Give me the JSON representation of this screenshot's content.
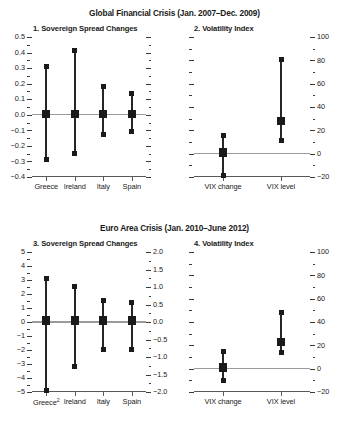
{
  "figure": {
    "blocks": [
      {
        "id": "global-financial-crisis",
        "title": "Global Financial Crisis (Jan. 2007–Dec. 2009)"
      },
      {
        "id": "euro-area-crisis",
        "title": "Euro Area Crisis (Jan. 2010–June 2012)"
      }
    ]
  },
  "chart_data": [
    {
      "type": "scatter",
      "id": "panel-1",
      "title": "1. Sovereign Spread Changes",
      "xlabel": "",
      "ylabel": "",
      "ylim": [
        -0.4,
        0.5
      ],
      "yticks": [
        -0.4,
        -0.3,
        -0.2,
        -0.1,
        0.0,
        0.1,
        0.2,
        0.3,
        0.4,
        0.5
      ],
      "yticklabels": [
        "-0.4",
        "-0.3",
        "-0.2",
        "-0.1",
        "0.0",
        "0.1",
        "0.2",
        "0.3",
        "0.4",
        "0.5"
      ],
      "y_minor_step": 0.05,
      "axis_side": "left",
      "right_axis_ticks_only": true,
      "grid": false,
      "zero_reference": 0.0,
      "categories": [
        "Greece",
        "Ireland",
        "Italy",
        "Spain"
      ],
      "series": [
        {
          "name": "upper",
          "values": [
            0.31,
            0.415,
            0.18,
            0.14
          ]
        },
        {
          "name": "middle",
          "values": [
            0.005,
            0.005,
            0.005,
            0.005
          ]
        },
        {
          "name": "lower",
          "values": [
            -0.29,
            -0.248,
            -0.128,
            -0.105
          ]
        }
      ]
    },
    {
      "type": "scatter",
      "id": "panel-2",
      "title": "2. Volatility Index",
      "xlabel": "",
      "ylabel": "",
      "ylim": [
        -20,
        100
      ],
      "yticks": [
        -20,
        0,
        20,
        40,
        60,
        80,
        100
      ],
      "yticklabels": [
        "-20",
        "0",
        "20",
        "40",
        "60",
        "80",
        "100"
      ],
      "y_minor_step": 10,
      "axis_side": "right",
      "left_axis_ticks_only": true,
      "grid": false,
      "zero_reference": 0,
      "categories": [
        "VIX change",
        "VIX level"
      ],
      "series": [
        {
          "name": "upper",
          "values": [
            15.5,
            81.0
          ]
        },
        {
          "name": "middle",
          "values": [
            1.0,
            28.0
          ]
        },
        {
          "name": "lower",
          "values": [
            -19.0,
            11.0
          ]
        }
      ]
    },
    {
      "type": "scatter",
      "id": "panel-3",
      "title": "3. Sovereign Spread Changes",
      "xlabel": "",
      "ylabel": "",
      "ylim": [
        -5,
        5
      ],
      "yticks": [
        -5,
        -4,
        -3,
        -2,
        -1,
        0,
        1,
        2,
        3,
        4,
        5
      ],
      "yticklabels": [
        "-5",
        "-4",
        "-3",
        "-2",
        "-1",
        "0",
        "1",
        "2",
        "3",
        "4",
        "5"
      ],
      "y_minor_step": 0.5,
      "axis_side": "left",
      "secondary_axis": {
        "ylim": [
          -2.0,
          2.0
        ],
        "yticks": [
          -2.0,
          -1.5,
          -1.0,
          -0.5,
          0.0,
          0.5,
          1.0,
          1.5,
          2.0
        ],
        "yticklabels": [
          "-2.0",
          "-1.5",
          "-1.0",
          "-0.5",
          "0.0",
          "0.5",
          "1.0",
          "1.5",
          "2.0"
        ],
        "y_minor_step": 0.25
      },
      "grid": false,
      "zero_reference": 0,
      "categories": [
        "Greece",
        "Ireland",
        "Italy",
        "Spain"
      ],
      "category_footnotes": {
        "Greece": "2"
      },
      "series": [
        {
          "name": "upper",
          "values": [
            3.1,
            2.55,
            1.55,
            1.4
          ]
        },
        {
          "name": "middle",
          "values": [
            0.12,
            0.12,
            0.12,
            0.12
          ]
        },
        {
          "name": "lower",
          "values": [
            -4.9,
            -3.15,
            -1.95,
            -1.95
          ]
        }
      ]
    },
    {
      "type": "scatter",
      "id": "panel-4",
      "title": "4. Volatility Index",
      "xlabel": "",
      "ylabel": "",
      "ylim": [
        -20,
        100
      ],
      "yticks": [
        -20,
        0,
        20,
        40,
        60,
        80,
        100
      ],
      "yticklabels": [
        "-20",
        "0",
        "20",
        "40",
        "60",
        "80",
        "100"
      ],
      "y_minor_step": 10,
      "axis_side": "right",
      "left_axis_ticks_only": true,
      "grid": false,
      "zero_reference": 0,
      "categories": [
        "VIX change",
        "VIX level"
      ],
      "series": [
        {
          "name": "upper",
          "values": [
            15.0,
            48.0
          ]
        },
        {
          "name": "middle",
          "values": [
            1.0,
            23.0
          ]
        },
        {
          "name": "lower",
          "values": [
            -10.0,
            14.0
          ]
        }
      ]
    }
  ],
  "colors": {
    "marker": "#1a1a1a",
    "stem": "#262626",
    "axis": "#5a5a5a",
    "zeroline": "#9a9a9a",
    "background": "#ffffff"
  }
}
